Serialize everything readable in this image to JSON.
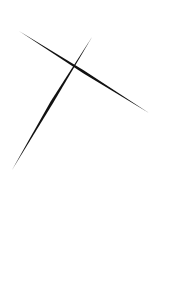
{
  "canvas": {
    "width": 185,
    "height": 287,
    "background": "#ffffff",
    "stroke_color": "#111111",
    "strokes": [
      {
        "name": "stroke-descending",
        "x1": 19,
        "y1": 31,
        "x2": 149,
        "y2": 113
      },
      {
        "name": "stroke-ascending",
        "x1": 92,
        "y1": 37,
        "x2": 12,
        "y2": 170
      }
    ]
  }
}
